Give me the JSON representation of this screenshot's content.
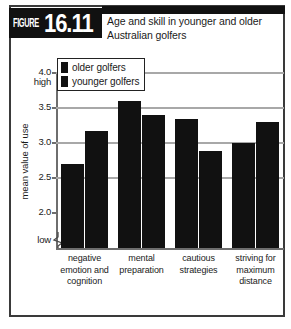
{
  "figure": {
    "label_word": "FIGURE",
    "number": "16.11",
    "title": "Age and skill in younger and older Australian golfers"
  },
  "legend": {
    "position": "top-left-inside",
    "items": [
      {
        "label": "older golfers",
        "color": "#111111"
      },
      {
        "label": "younger golfers",
        "color": "#111111"
      }
    ]
  },
  "axis": {
    "y_label": "mean value of use",
    "high_label": "high",
    "low_label": "low",
    "ticks": [
      "4.0",
      "3.5",
      "3.0",
      "2.5",
      "2.0"
    ],
    "break_symbol": "axis-break-zigzag"
  },
  "chart_data": {
    "type": "bar",
    "title": "Age and skill in younger and older Australian golfers",
    "xlabel": "",
    "ylabel": "mean value of use",
    "ylim": [
      2.0,
      4.0
    ],
    "yticks": [
      2.0,
      2.5,
      3.0,
      3.5,
      4.0
    ],
    "ytick_labels": [
      "2.0",
      "2.5",
      "3.0",
      "3.5",
      "4.0"
    ],
    "y_axis_low_label": "low",
    "y_axis_high_label": "high",
    "axis_break": true,
    "grid": true,
    "grid_axis": "y",
    "legend_position": "upper left",
    "categories": [
      "negative emotion and cognition",
      "mental preparation",
      "cautious strategies",
      "striving for maximum distance"
    ],
    "category_lines": [
      [
        "negative",
        "emotion and",
        "cognition"
      ],
      [
        "mental",
        "preparation"
      ],
      [
        "cautious",
        "strategies"
      ],
      [
        "striving for",
        "maximum",
        "distance"
      ]
    ],
    "series": [
      {
        "name": "older golfers",
        "color": "#111111",
        "values": [
          2.68,
          3.58,
          3.33,
          2.98
        ]
      },
      {
        "name": "younger golfers",
        "color": "#111111",
        "values": [
          3.16,
          3.38,
          2.87,
          3.29
        ]
      }
    ]
  }
}
